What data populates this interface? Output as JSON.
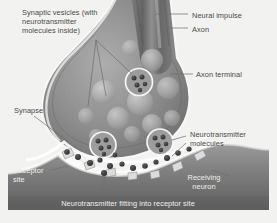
{
  "figure": {
    "style": "grayscale airbrush illustration",
    "background_color": "#f2f2f0"
  },
  "labels": {
    "synaptic_vesicles": "Synaptic vesicles (with\nneurotransmitter\nmolecules inside)",
    "neural_impulse": "Neural impulse",
    "axon": "Axon",
    "axon_terminal": "Axon terminal",
    "synapse": "Synapse",
    "neurotransmitter_molecules": "Neurotransmitter\nmolecules",
    "receptor_site": "Receptor\nsite",
    "receiving_neuron": "Receiving\nneuron",
    "caption_bottom": "Neurotransmitter fitting into receptor site"
  },
  "colors": {
    "label_text": "#4a4a4a",
    "label_text_on_dark": "#efefef",
    "leader_line": "#6e6e6e",
    "axon_dark": "#6f6f6f",
    "axon_highlight": "#9c9c9c",
    "terminal_fill": "#8a8a8a",
    "vesicle_fill": "#b5b5b5",
    "cleft_white": "#fbfbfa",
    "molecule": "#3c3c3c",
    "receiving_neuron": "#8d8d8d",
    "receiving_neuron_dark": "#6a6a6a"
  },
  "structures": {
    "axon": "tapering dark tube descending from top center with a lighter highlight stripe",
    "axon_terminal": "bulbous end-foot of the axon filled with vesicles",
    "synaptic_cleft": "bright white gap between terminal membrane and receiving neuron",
    "receiving_neuron": "dark band across the bottom with an undulating upper membrane and receptor notches"
  },
  "counts": {
    "plain_vesicles": 11,
    "circled_vesicles": 3,
    "free_molecules_in_cleft": 14,
    "receptor_notches": 7
  }
}
